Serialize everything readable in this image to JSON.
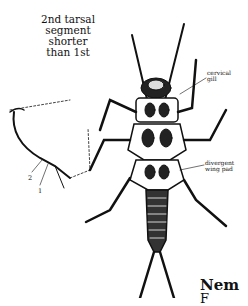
{
  "figure": {
    "callout": [
      "2nd tarsal",
      "segment",
      "shorter",
      "than 1st"
    ],
    "labels": {
      "cervical_gill": [
        "cervical",
        "gill"
      ],
      "divergent_wing_pad": [
        "divergent",
        "wing pad"
      ],
      "segment_numbers": [
        "2",
        "1"
      ]
    }
  },
  "page": {
    "heading_fragment": "Nem",
    "next_line_fragment": "F"
  },
  "colors": {
    "ink": "#111111",
    "paper": "#ffffff"
  }
}
